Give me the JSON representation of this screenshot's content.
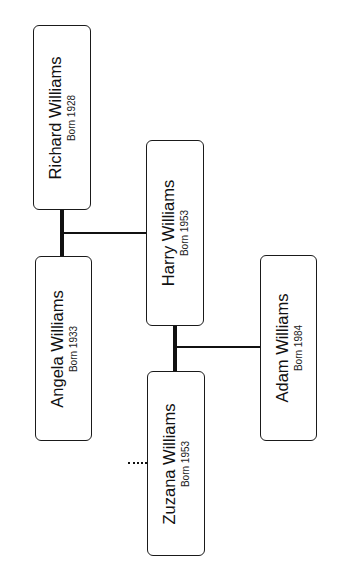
{
  "diagram": {
    "type": "family-tree",
    "orientation": "rotated-90-ccw",
    "people": [
      {
        "id": "richard",
        "name": "Richard Williams",
        "born": "Born 1928"
      },
      {
        "id": "angela",
        "name": "Angela Williams",
        "born": "Born 1933"
      },
      {
        "id": "harry",
        "name": "Harry Williams",
        "born": "Born 1953"
      },
      {
        "id": "zuzana",
        "name": "Zuzana Williams",
        "born": "Born 1953"
      },
      {
        "id": "adam",
        "name": "Adam Williams",
        "born": "Born 1984"
      }
    ],
    "relationships": [
      {
        "type": "marriage",
        "between": [
          "richard",
          "angela"
        ]
      },
      {
        "type": "child",
        "parents": [
          "richard",
          "angela"
        ],
        "child": "harry"
      },
      {
        "type": "marriage",
        "between": [
          "harry",
          "zuzana"
        ]
      },
      {
        "type": "child",
        "parents": [
          "harry",
          "zuzana"
        ],
        "child": "adam"
      },
      {
        "type": "dotted-link",
        "from": "zuzana",
        "direction": "left"
      }
    ],
    "colors": {
      "line": "#111111",
      "box_border": "#1a1a1a",
      "background": "#ffffff"
    }
  }
}
